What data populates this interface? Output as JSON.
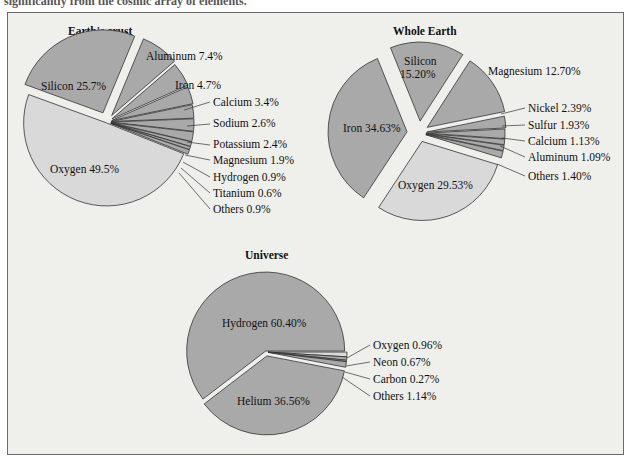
{
  "caption": "significantly from the cosmic array of elements.",
  "colors": {
    "slice_dark": "#a9a9a9",
    "slice_light": "#d9d9d9",
    "outline": "#333333",
    "background": "#efefec"
  },
  "chart_data": [
    {
      "type": "pie",
      "title": "Earth's crust",
      "categories": [
        "Oxygen",
        "Silicon",
        "Aluminum",
        "Iron",
        "Calcium",
        "Sodium",
        "Potassium",
        "Magnesium",
        "Hydrogen",
        "Titanium",
        "Others"
      ],
      "values": [
        49.5,
        25.7,
        7.4,
        4.7,
        3.4,
        2.6,
        2.4,
        1.9,
        0.9,
        0.6,
        0.9
      ],
      "labels": [
        "Oxygen 49.5%",
        "Silicon 25.7%",
        "Aluminum 7.4%",
        "Iron 4.7%",
        "Calcium 3.4%",
        "Sodium 2.6%",
        "Potassium 2.4%",
        "Magnesium 1.9%",
        "Hydrogen 0.9%",
        "Titanium 0.6%",
        "Others 0.9%"
      ],
      "unit": "%"
    },
    {
      "type": "pie",
      "title": "Whole Earth",
      "categories": [
        "Iron",
        "Oxygen",
        "Silicon",
        "Magnesium",
        "Nickel",
        "Sulfur",
        "Calcium",
        "Aluminum",
        "Others"
      ],
      "values": [
        34.63,
        29.53,
        15.2,
        12.7,
        2.39,
        1.93,
        1.13,
        1.09,
        1.4
      ],
      "labels": [
        "Iron 34.63%",
        "Oxygen 29.53%",
        "Silicon 15.20%",
        "Magnesium 12.70%",
        "Nickel 2.39%",
        "Sulfur 1.93%",
        "Calcium 1.13%",
        "Aluminum 1.09%",
        "Others 1.40%"
      ],
      "unit": "%"
    },
    {
      "type": "pie",
      "title": "Universe",
      "categories": [
        "Hydrogen",
        "Helium",
        "Oxygen",
        "Neon",
        "Carbon",
        "Others"
      ],
      "values": [
        60.4,
        36.56,
        0.96,
        0.67,
        0.27,
        1.14
      ],
      "labels": [
        "Hydrogen 60.40%",
        "Helium 36.56%",
        "Oxygen 0.96%",
        "Neon 0.67%",
        "Carbon 0.27%",
        "Others 1.14%"
      ],
      "unit": "%"
    }
  ],
  "crust": {
    "title": "Earth's crust",
    "silicon": "Silicon 25.7%",
    "oxygen": "Oxygen 49.5%",
    "aluminum": "Aluminum 7.4%",
    "iron": "Iron 4.7%",
    "calcium": "Calcium 3.4%",
    "sodium": "Sodium 2.6%",
    "potassium": "Potassium 2.4%",
    "magnesium": "Magnesium 1.9%",
    "hydrogen": "Hydrogen 0.9%",
    "titanium": "Titanium 0.6%",
    "others": "Others 0.9%"
  },
  "whole": {
    "title": "Whole Earth",
    "silicon1": "Silicon",
    "silicon2": "15.20%",
    "magnesium": "Magnesium 12.70%",
    "iron": "Iron 34.63%",
    "oxygen": "Oxygen 29.53%",
    "nickel": "Nickel 2.39%",
    "sulfur": "Sulfur 1.93%",
    "calcium": "Calcium 1.13%",
    "aluminum": "Aluminum 1.09%",
    "others": "Others 1.40%"
  },
  "universe": {
    "title": "Universe",
    "hydrogen": "Hydrogen 60.40%",
    "helium": "Helium 36.56%",
    "oxygen": "Oxygen 0.96%",
    "neon": "Neon 0.67%",
    "carbon": "Carbon 0.27%",
    "others": "Others 1.14%"
  }
}
